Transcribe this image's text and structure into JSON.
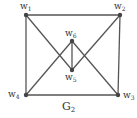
{
  "graph": {
    "title": "G",
    "title_sub": "2",
    "colors": {
      "edge": "#555555",
      "node": "#444444",
      "text": "#333333"
    },
    "nodes": [
      {
        "id": "w1",
        "base": "w",
        "sub": "1",
        "x": 26,
        "y": 15,
        "label_x": 20,
        "label_y": 2
      },
      {
        "id": "w2",
        "base": "w",
        "sub": "2",
        "x": 120,
        "y": 15,
        "label_x": 114,
        "label_y": 2
      },
      {
        "id": "w3",
        "base": "w",
        "sub": "3",
        "x": 118,
        "y": 95,
        "label_x": 123,
        "label_y": 91
      },
      {
        "id": "w4",
        "base": "w",
        "sub": "4",
        "x": 26,
        "y": 95,
        "label_x": 8,
        "label_y": 90
      },
      {
        "id": "w5",
        "base": "w",
        "sub": "5",
        "x": 72,
        "y": 70,
        "label_x": 65,
        "label_y": 73
      },
      {
        "id": "w6",
        "base": "w",
        "sub": "6",
        "x": 72,
        "y": 41,
        "label_x": 65,
        "label_y": 29
      }
    ],
    "edges": [
      [
        "w1",
        "w2"
      ],
      [
        "w2",
        "w3"
      ],
      [
        "w3",
        "w4"
      ],
      [
        "w4",
        "w1"
      ],
      [
        "w1",
        "w5"
      ],
      [
        "w2",
        "w5"
      ],
      [
        "w4",
        "w6"
      ],
      [
        "w3",
        "w6"
      ],
      [
        "w5",
        "w6"
      ]
    ]
  }
}
